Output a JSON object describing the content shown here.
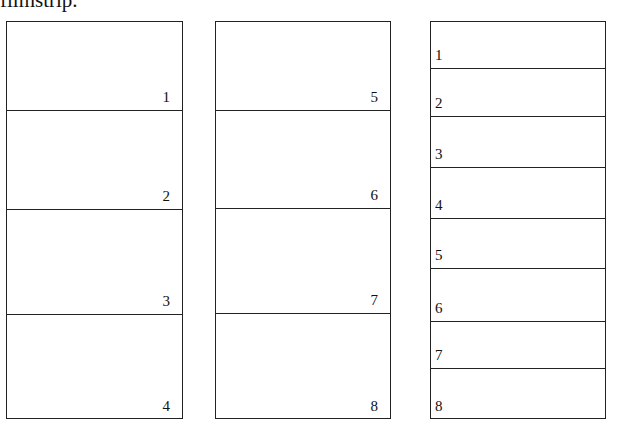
{
  "caption": "filmstrip.",
  "strips": [
    {
      "name": "strip-1",
      "box": {
        "left": 6,
        "top": 21,
        "width": 177,
        "height": 398
      },
      "align": "right",
      "cells": [
        {
          "label": "1",
          "top": 0,
          "height": 89
        },
        {
          "label": "2",
          "top": 89,
          "height": 99
        },
        {
          "label": "3",
          "top": 188,
          "height": 105
        },
        {
          "label": "4",
          "top": 293,
          "height": 105
        }
      ]
    },
    {
      "name": "strip-2",
      "box": {
        "left": 215,
        "top": 21,
        "width": 176,
        "height": 398
      },
      "align": "right",
      "cells": [
        {
          "label": "5",
          "top": 0,
          "height": 89
        },
        {
          "label": "6",
          "top": 89,
          "height": 98
        },
        {
          "label": "7",
          "top": 187,
          "height": 105
        },
        {
          "label": "8",
          "top": 292,
          "height": 106
        }
      ]
    },
    {
      "name": "strip-3",
      "box": {
        "left": 430,
        "top": 21,
        "width": 176,
        "height": 398
      },
      "align": "left",
      "cells": [
        {
          "label": "1",
          "top": 0,
          "height": 47
        },
        {
          "label": "2",
          "top": 47,
          "height": 48
        },
        {
          "label": "3",
          "top": 95,
          "height": 51
        },
        {
          "label": "4",
          "top": 146,
          "height": 51
        },
        {
          "label": "5",
          "top": 197,
          "height": 50
        },
        {
          "label": "6",
          "top": 247,
          "height": 53
        },
        {
          "label": "7",
          "top": 300,
          "height": 47
        },
        {
          "label": "8",
          "top": 347,
          "height": 51
        }
      ]
    }
  ]
}
